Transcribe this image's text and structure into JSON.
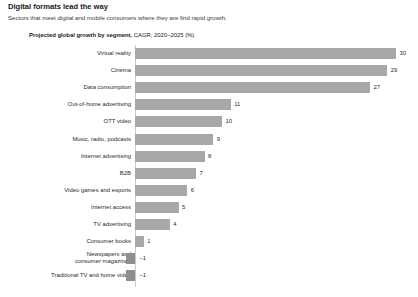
{
  "header": {
    "title": "Digital formats lead the way",
    "subtitle": "Sectors that meet digital and mobile consumers where they are find rapid growth."
  },
  "chart_subtitle": {
    "bold": "Projected global growth by segment,",
    "normal": " CAGR, 2020–2025 (%)"
  },
  "colors": {
    "bar": "#a8a8a8",
    "bar_negative": "#8f8f8f",
    "axis": "#c9c9c9",
    "text": "#2b2b2b"
  },
  "chart_data": {
    "type": "bar",
    "orientation": "horizontal",
    "title": "Projected global growth by segment, CAGR, 2020–2025 (%)",
    "xlabel": "",
    "ylabel": "",
    "xlim": [
      -1,
      30
    ],
    "grid": false,
    "legend": "none",
    "categories": [
      "Virtual reality",
      "Cinema",
      "Data consumption",
      "Out-of-home advertising",
      "OTT video",
      "Music, radio, podcasts",
      "Internet advertising",
      "B2B",
      "Video games and esports",
      "Internet access",
      "TV advertising",
      "Consumer books",
      "Newspapers and\nconsumer magazines",
      "Traditional TV and home video"
    ],
    "values": [
      30,
      29,
      27,
      11,
      10,
      9,
      8,
      7,
      6,
      5,
      4,
      1,
      -1,
      -1
    ],
    "value_labels": [
      "30",
      "29",
      "27",
      "11",
      "10",
      "9",
      "8",
      "7",
      "6",
      "5",
      "4",
      "1",
      "–1",
      "–1"
    ]
  }
}
